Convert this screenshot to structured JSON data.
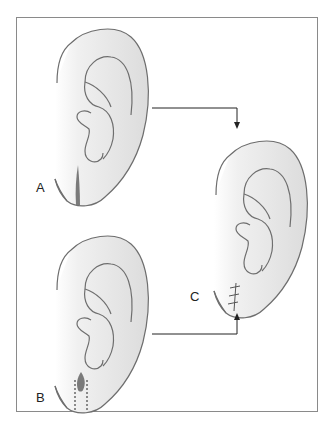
{
  "figure": {
    "panels": [
      {
        "id": "A",
        "label": "A",
        "description": "Ear with linear split earlobe defect"
      },
      {
        "id": "B",
        "label": "B",
        "description": "Ear with earlobe defect and dashed excision lines"
      },
      {
        "id": "C",
        "label": "C",
        "description": "Repaired ear with sutured earlobe"
      }
    ],
    "arrows": [
      {
        "from": "A",
        "to": "C"
      },
      {
        "from": "B",
        "to": "C"
      }
    ],
    "colors": {
      "outline": "#6e6e6e",
      "ear_fill": "#e4e4e4",
      "defect": "#7a7a7a",
      "frame": "#8a8a8a",
      "arrow": "#222222"
    }
  }
}
